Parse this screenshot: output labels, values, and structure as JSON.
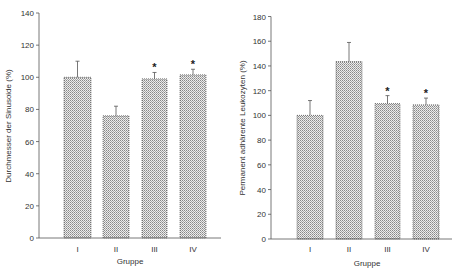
{
  "chart_data": [
    {
      "type": "bar",
      "title": "",
      "xlabel": "Gruppe",
      "ylabel": "Durchmesser der Sinusoide (%)",
      "categories": [
        "I",
        "II",
        "III",
        "IV"
      ],
      "values": [
        100,
        76,
        99,
        101.5
      ],
      "error_upper": [
        110,
        82,
        103,
        105
      ],
      "significance": [
        "",
        "",
        "*",
        "*"
      ],
      "ylim": [
        0,
        140
      ],
      "yticks": [
        0,
        20,
        40,
        60,
        80,
        100,
        120,
        140
      ],
      "grid": false,
      "legend": null
    },
    {
      "type": "bar",
      "title": "",
      "xlabel": "Gruppe",
      "ylabel": "Permanent adhärente Leukozyten (%)",
      "categories": [
        "I",
        "II",
        "III",
        "IV"
      ],
      "values": [
        100,
        143.5,
        109.5,
        108.5
      ],
      "error_upper": [
        112,
        159,
        116,
        114
      ],
      "significance": [
        "",
        "",
        "*",
        "*"
      ],
      "ylim": [
        0,
        180
      ],
      "yticks": [
        0,
        20,
        40,
        60,
        80,
        100,
        120,
        140,
        160,
        180
      ],
      "grid": false,
      "legend": null
    }
  ],
  "colors": {
    "axis": "#555555",
    "bar_fill_light": "#e8e8e8",
    "bar_fill_dot": "#8a8a8a",
    "bar_border": "#444444",
    "text": "#333333"
  }
}
